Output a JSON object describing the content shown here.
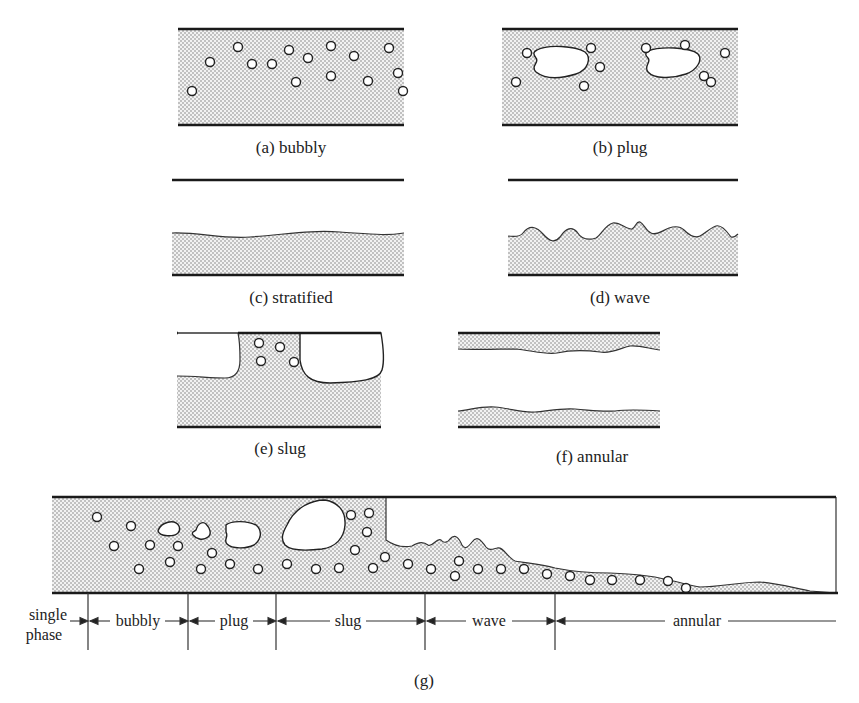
{
  "figure": {
    "panels": [
      {
        "id": "a",
        "caption": "(a) bubbly",
        "regime": "bubbly"
      },
      {
        "id": "b",
        "caption": "(b) plug",
        "regime": "plug"
      },
      {
        "id": "c",
        "caption": "(c) stratified",
        "regime": "stratified"
      },
      {
        "id": "d",
        "caption": "(d) wave",
        "regime": "wave"
      },
      {
        "id": "e",
        "caption": "(e) slug",
        "regime": "slug"
      },
      {
        "id": "f",
        "caption": "(f) annular",
        "regime": "annular"
      }
    ],
    "combined": {
      "caption": "(g)",
      "regions": [
        {
          "label_line1": "single",
          "label_line2": "phase"
        },
        {
          "label": "bubbly"
        },
        {
          "label": "plug"
        },
        {
          "label": "slug"
        },
        {
          "label": "wave"
        },
        {
          "label": "annular"
        }
      ]
    }
  },
  "colors": {
    "wall": "#1a1a1a",
    "liquid_dots": "#555555",
    "background": "#ffffff"
  }
}
